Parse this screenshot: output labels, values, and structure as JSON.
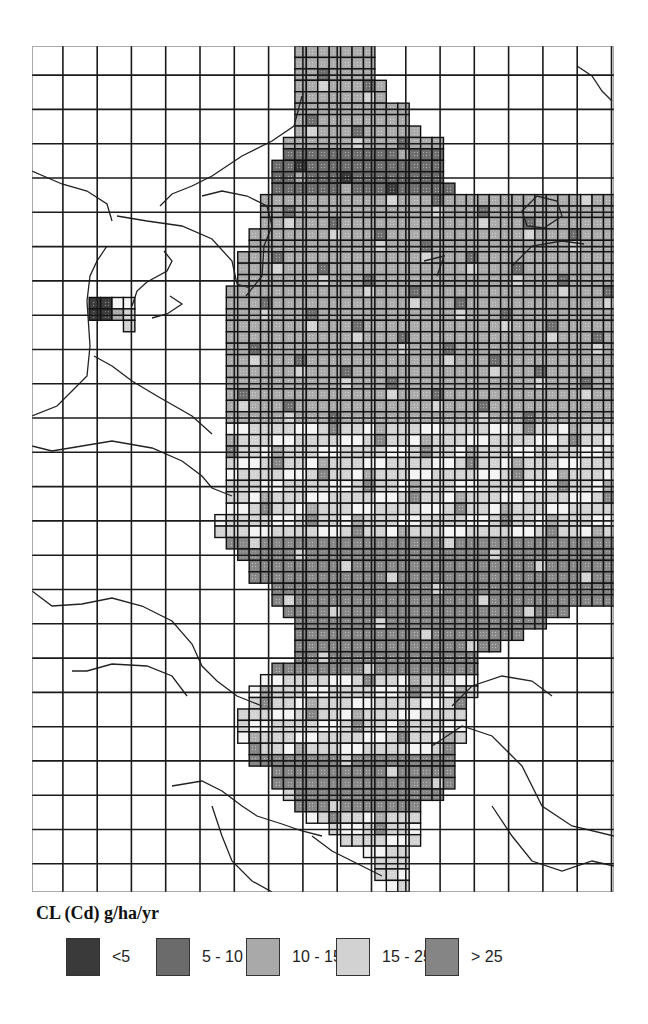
{
  "figure": {
    "legend_title": "CL (Cd) g/ha/yr",
    "legend": [
      {
        "label": "<5",
        "color": "#3a3a3a",
        "x": 66
      },
      {
        "label": "5 - 10",
        "color": "#6b6b6b",
        "x": 156
      },
      {
        "label": "10 - 15",
        "color": "#a9a9a9",
        "x": 246
      },
      {
        "label": "15 - 25",
        "color": "#d2d2d2",
        "x": 336
      },
      {
        "label": "> 25",
        "color": "#858585",
        "x": 425
      }
    ]
  },
  "chart_data": {
    "type": "heatmap",
    "title": "CL (Cd) g/ha/yr",
    "grid": {
      "origin_x": 0,
      "origin_y": 0,
      "cell": 11.43,
      "cols": 51,
      "rows": 74,
      "coarse_every": 3
    },
    "classes": [
      "<5",
      "5 - 10",
      "10 - 15",
      "15 - 25",
      "> 25"
    ],
    "class_colors": [
      "#3a3a3a",
      "#6b6b6b",
      "#a9a9a9",
      "#d2d2d2",
      "#858585"
    ],
    "row_spans": [
      [
        0,
        23,
        30,
        2
      ],
      [
        1,
        23,
        30,
        2
      ],
      [
        2,
        23,
        30,
        2
      ],
      [
        3,
        23,
        31,
        2
      ],
      [
        4,
        23,
        31,
        2
      ],
      [
        5,
        23,
        33,
        2
      ],
      [
        6,
        23,
        33,
        2
      ],
      [
        7,
        23,
        34,
        2
      ],
      [
        8,
        22,
        36,
        2
      ],
      [
        9,
        22,
        36,
        1
      ],
      [
        10,
        21,
        36,
        1
      ],
      [
        11,
        21,
        36,
        1
      ],
      [
        12,
        21,
        37,
        1
      ],
      [
        13,
        20,
        51,
        2
      ],
      [
        14,
        20,
        51,
        2
      ],
      [
        15,
        20,
        51,
        2
      ],
      [
        16,
        19,
        51,
        2
      ],
      [
        17,
        19,
        51,
        2
      ],
      [
        18,
        18,
        51,
        2
      ],
      [
        19,
        18,
        51,
        2
      ],
      [
        20,
        18,
        51,
        2
      ],
      [
        21,
        17,
        51,
        2
      ],
      [
        22,
        17,
        51,
        2
      ],
      [
        23,
        17,
        51,
        2
      ],
      [
        24,
        17,
        51,
        2
      ],
      [
        25,
        17,
        51,
        2
      ],
      [
        26,
        17,
        51,
        2
      ],
      [
        27,
        17,
        51,
        2
      ],
      [
        28,
        17,
        51,
        2
      ],
      [
        29,
        17,
        51,
        2
      ],
      [
        30,
        17,
        51,
        2
      ],
      [
        31,
        17,
        51,
        2
      ],
      [
        32,
        17,
        51,
        2
      ],
      [
        33,
        17,
        51,
        3
      ],
      [
        34,
        17,
        51,
        3
      ],
      [
        35,
        17,
        51,
        3
      ],
      [
        36,
        17,
        51,
        3
      ],
      [
        37,
        17,
        51,
        3
      ],
      [
        38,
        17,
        51,
        3
      ],
      [
        39,
        17,
        51,
        3
      ],
      [
        40,
        17,
        51,
        3
      ],
      [
        41,
        16,
        51,
        3
      ],
      [
        42,
        16,
        51,
        3
      ],
      [
        43,
        17,
        51,
        4
      ],
      [
        44,
        18,
        51,
        4
      ],
      [
        45,
        19,
        51,
        4
      ],
      [
        46,
        19,
        51,
        4
      ],
      [
        47,
        21,
        51,
        4
      ],
      [
        48,
        21,
        51,
        4
      ],
      [
        49,
        22,
        47,
        4
      ],
      [
        50,
        23,
        45,
        4
      ],
      [
        51,
        23,
        43,
        4
      ],
      [
        52,
        23,
        41,
        4
      ],
      [
        53,
        23,
        39,
        4
      ],
      [
        54,
        21,
        39,
        4
      ],
      [
        55,
        20,
        39,
        3
      ],
      [
        56,
        19,
        39,
        3
      ],
      [
        57,
        19,
        38,
        3
      ],
      [
        58,
        18,
        38,
        3
      ],
      [
        59,
        18,
        38,
        3
      ],
      [
        60,
        18,
        38,
        3
      ],
      [
        61,
        19,
        37,
        3
      ],
      [
        62,
        19,
        37,
        4
      ],
      [
        63,
        21,
        37,
        4
      ],
      [
        64,
        21,
        37,
        4
      ],
      [
        65,
        22,
        36,
        4
      ],
      [
        66,
        23,
        34,
        4
      ],
      [
        67,
        24,
        34,
        3
      ],
      [
        68,
        26,
        34,
        3
      ],
      [
        69,
        27,
        34,
        3
      ],
      [
        70,
        29,
        33,
        3
      ],
      [
        71,
        30,
        33,
        3
      ],
      [
        72,
        30,
        33,
        3
      ],
      [
        73,
        31,
        33,
        3
      ]
    ],
    "isolated_cells": [
      [
        22,
        5,
        0
      ],
      [
        22,
        6,
        0
      ],
      [
        23,
        5,
        0
      ],
      [
        23,
        6,
        0
      ],
      [
        22,
        7,
        3
      ],
      [
        22,
        8,
        3
      ],
      [
        23,
        7,
        3
      ],
      [
        23,
        8,
        3
      ],
      [
        24,
        8,
        3
      ]
    ]
  }
}
